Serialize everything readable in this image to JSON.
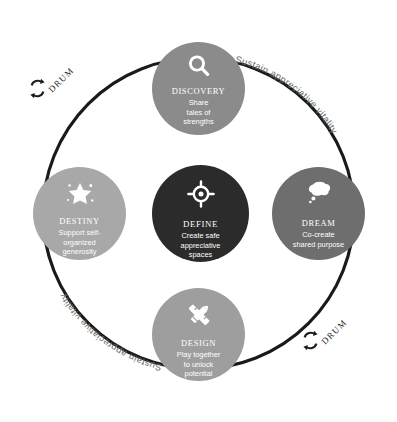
{
  "diagram": {
    "colors": {
      "background": "#ffffff",
      "ring": "#1a1a1a",
      "define": "#2b2b2b",
      "dream": "#6e6e6e",
      "discovery": "#8b8b8b",
      "design": "#9e9e9e",
      "destiny": "#a8a8a8",
      "label_text": "#6d6d6d",
      "node_text": "#ffffff"
    },
    "center": {
      "id": "define",
      "title": "DEFINE",
      "description": "Create safe appreciative spaces",
      "description_lines": [
        "Create safe",
        "appreciative",
        "spaces"
      ],
      "icon": "target-crosshair-icon",
      "color": "#2b2b2b"
    },
    "nodes": [
      {
        "id": "discovery",
        "title": "DISCOVERY",
        "description": "Share tales of strengths",
        "description_lines": [
          "Share",
          "tales of",
          "strengths"
        ],
        "icon": "magnifying-glass-icon",
        "color": "#8b8b8b",
        "position": "top"
      },
      {
        "id": "dream",
        "title": "DREAM",
        "description": "Co-create shared purpose",
        "description_lines": [
          "Co-create",
          "shared purpose"
        ],
        "icon": "thought-bubble-icon",
        "color": "#6e6e6e",
        "position": "right"
      },
      {
        "id": "design",
        "title": "DESIGN",
        "description": "Play together to unlock potential",
        "description_lines": [
          "Play together",
          "to unlock",
          "potential"
        ],
        "icon": "pencil-ruler-icon",
        "color": "#9e9e9e",
        "position": "bottom"
      },
      {
        "id": "destiny",
        "title": "DESTINY",
        "description": "Support self-organized generosity",
        "description_lines": [
          "Support self-",
          "organized",
          "generosity"
        ],
        "icon": "star-sparkle-icon",
        "color": "#a8a8a8",
        "position": "left"
      }
    ],
    "cycle_markers": [
      {
        "id": "drum-top-left",
        "label": "DRUM",
        "icon": "recycle-cycle-arrows-icon",
        "position": "top-left"
      },
      {
        "id": "drum-bottom-right",
        "label": "DRUM",
        "icon": "recycle-cycle-arrows-icon",
        "position": "bottom-right"
      }
    ],
    "arc_labels": [
      {
        "id": "arc-top-right",
        "text": "Sustain appreciative vitality",
        "position": "top-right"
      },
      {
        "id": "arc-bottom-left",
        "text": "Sustain appreciative vitality",
        "position": "bottom-left"
      }
    ]
  }
}
